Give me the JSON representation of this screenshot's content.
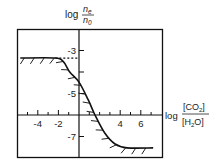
{
  "chart_data": {
    "type": "line",
    "title": "",
    "ylabel": {
      "prefix": "log",
      "numerator": "n",
      "numerator_sub": "e",
      "denominator": "n",
      "denominator_sub": "0"
    },
    "xlabel": {
      "prefix": "log",
      "numerator": "[CO2]",
      "numerator_main": "[CO",
      "numerator_sub": "2",
      "numerator_end": "]",
      "denominator": "[H2O]",
      "denominator_main": "[H",
      "denominator_sub": "2",
      "denominator_end": "O]"
    },
    "x_ticks": [
      {
        "value": -4,
        "label": "-4"
      },
      {
        "value": -2,
        "label": "-2"
      },
      {
        "value": 4,
        "label": "4"
      },
      {
        "value": 6,
        "label": "6"
      }
    ],
    "x_minor_ticks": [
      -5,
      -3,
      -1,
      1,
      2,
      3,
      5,
      7
    ],
    "y_ticks": [
      {
        "value": -3,
        "label": "-3"
      },
      {
        "value": -4,
        "label": ""
      },
      {
        "value": -5,
        "label": "-5"
      },
      {
        "value": -7,
        "label": "-7"
      }
    ],
    "xlim": [
      -6.0,
      8.0
    ],
    "ylim": [
      -8.0,
      -1.2
    ],
    "x_axis_at_y": -6,
    "y_axis_at_x": 0,
    "grid": false,
    "legend": null,
    "reference_line": {
      "style": "dotted",
      "y": -3.35,
      "x_from": -2.3,
      "x_to": 0
    },
    "series": [
      {
        "name": "boundary",
        "style": "solid-hatched",
        "x": [
          -5.7,
          -2.3,
          -1.5,
          -0.9,
          0.0,
          0.9,
          1.55,
          2.5,
          3.5,
          4.66,
          7.2
        ],
        "y": [
          -3.35,
          -3.35,
          -3.53,
          -4.0,
          -4.47,
          -5.3,
          -6.0,
          -6.84,
          -7.35,
          -7.53,
          -7.53
        ]
      }
    ]
  }
}
